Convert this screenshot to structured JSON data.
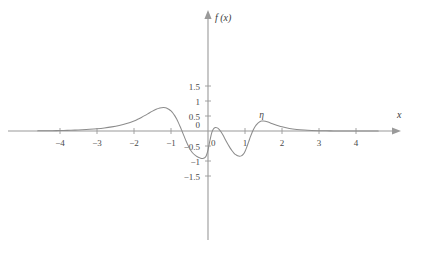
{
  "chart_data": {
    "type": "line",
    "title": "",
    "xlabel": "x",
    "ylabel": "f(x)",
    "xlim": [
      -4.6,
      4.6
    ],
    "ylim": [
      -1.8,
      1.8
    ],
    "grid": false,
    "legend": "none",
    "x_ticks": [
      -4,
      -3,
      -2,
      -1,
      0,
      1,
      2,
      3,
      4
    ],
    "x_tick_labels": [
      "-4",
      "-3",
      "-2",
      "-1",
      "0",
      "1",
      "2",
      "3",
      "4"
    ],
    "y_ticks": [
      -1.5,
      -1,
      -0.5,
      0,
      0.5,
      1,
      1.5
    ],
    "y_tick_labels": [
      "-1.5",
      "-1",
      "-0.5",
      "0",
      "0.5",
      "1",
      "1.5"
    ],
    "annotations": [
      {
        "text": "η",
        "x": 1.45,
        "y": 0.45,
        "points_to_x": 1.45,
        "points_to_y": 0.33
      }
    ],
    "series": [
      {
        "name": "f",
        "color": "#8c8c8c",
        "x": [
          -4.6,
          -4.4,
          -4.2,
          -4.0,
          -3.8,
          -3.6,
          -3.4,
          -3.2,
          -3.0,
          -2.8,
          -2.6,
          -2.4,
          -2.2,
          -2.0,
          -1.9,
          -1.8,
          -1.7,
          -1.6,
          -1.5,
          -1.4,
          -1.3,
          -1.25,
          -1.2,
          -1.15,
          -1.1,
          -1.05,
          -1.0,
          -0.95,
          -0.9,
          -0.85,
          -0.8,
          -0.75,
          -0.7,
          -0.65,
          -0.6,
          -0.55,
          -0.5,
          -0.45,
          -0.4,
          -0.35,
          -0.3,
          -0.25,
          -0.2,
          -0.15,
          -0.1,
          -0.05,
          0.0,
          0.05,
          0.1,
          0.15,
          0.2,
          0.25,
          0.3,
          0.35,
          0.4,
          0.45,
          0.5,
          0.55,
          0.6,
          0.65,
          0.7,
          0.75,
          0.8,
          0.85,
          0.9,
          0.95,
          1.0,
          1.05,
          1.1,
          1.15,
          1.2,
          1.25,
          1.3,
          1.35,
          1.4,
          1.45,
          1.5,
          1.55,
          1.6,
          1.7,
          1.8,
          1.9,
          2.0,
          2.2,
          2.4,
          2.6,
          2.8,
          3.0,
          3.3,
          3.6,
          4.0,
          4.4,
          4.6
        ],
        "y": [
          0.005,
          0.007,
          0.01,
          0.015,
          0.021,
          0.029,
          0.04,
          0.055,
          0.075,
          0.102,
          0.138,
          0.186,
          0.25,
          0.335,
          0.39,
          0.452,
          0.52,
          0.592,
          0.663,
          0.725,
          0.766,
          0.777,
          0.78,
          0.772,
          0.752,
          0.718,
          0.668,
          0.6,
          0.512,
          0.405,
          0.28,
          0.14,
          -0.01,
          -0.163,
          -0.313,
          -0.452,
          -0.574,
          -0.674,
          -0.75,
          -0.805,
          -0.85,
          -0.884,
          -0.905,
          -0.915,
          -0.9,
          -0.83,
          -0.64,
          -0.33,
          -0.06,
          0.075,
          0.118,
          0.105,
          0.055,
          -0.025,
          -0.125,
          -0.24,
          -0.36,
          -0.47,
          -0.57,
          -0.66,
          -0.735,
          -0.79,
          -0.825,
          -0.84,
          -0.83,
          -0.78,
          -0.68,
          -0.53,
          -0.355,
          -0.18,
          -0.025,
          0.1,
          0.195,
          0.265,
          0.31,
          0.33,
          0.332,
          0.322,
          0.305,
          0.262,
          0.216,
          0.174,
          0.138,
          0.085,
          0.051,
          0.03,
          0.017,
          0.01,
          0.004,
          0.002,
          0.001,
          0.0,
          0.0
        ]
      }
    ]
  },
  "axis": {
    "x_name": "x",
    "y_name": "f (x)"
  }
}
